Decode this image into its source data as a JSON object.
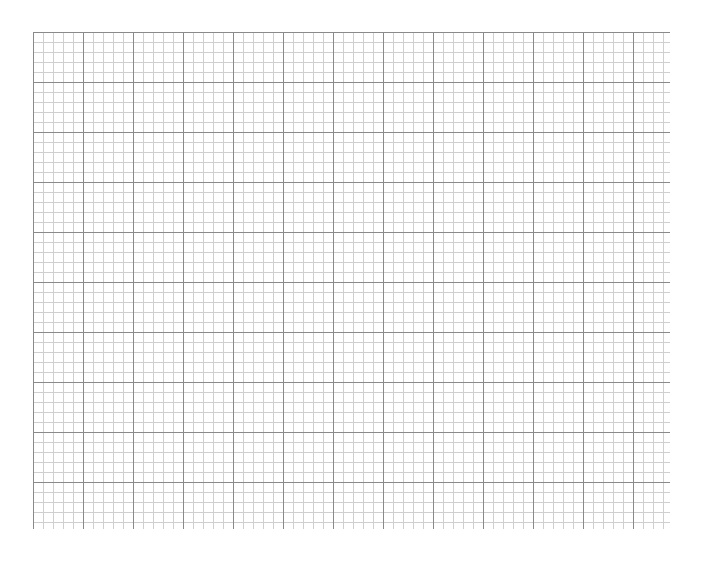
{
  "grid": {
    "left": 33,
    "top": 32,
    "width": 637,
    "height": 497,
    "minor_spacing": 10,
    "major_spacing": 50,
    "minor_color": "#cfcfcf",
    "major_color": "#8a8a8a"
  }
}
